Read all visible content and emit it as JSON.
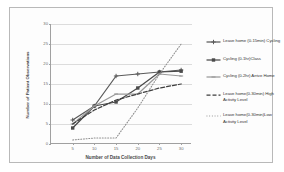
{
  "chart_data": {
    "type": "line",
    "title": "",
    "xlabel": "Number of Data Collection Days",
    "ylabel": "Number of Patient Observations",
    "x": [
      5,
      10,
      15,
      20,
      25,
      30
    ],
    "xlim": [
      0,
      32.5
    ],
    "ylim": [
      0,
      30
    ],
    "xticks": [
      "5",
      "10",
      "15",
      "20",
      "25",
      "30"
    ],
    "yticks": [
      "0",
      "5",
      "10",
      "15",
      "20",
      "25",
      "30"
    ],
    "grid": true,
    "legend_position": "right",
    "series": [
      {
        "name": "Leave home (0-15min) Cycling",
        "values": [
          6,
          9.5,
          17,
          17.5,
          18,
          18.5
        ],
        "color": "#5a5a5a",
        "marker": "plus",
        "dash": "none"
      },
      {
        "name": "Cycling (0-1hr)Class",
        "values": [
          4,
          9.5,
          10.5,
          14,
          18,
          18.2
        ],
        "color": "#4a4a4a",
        "marker": "square",
        "dash": "none"
      },
      {
        "name": "Cycling (0-2hr) Arrive Home",
        "values": [
          5,
          9.5,
          12.5,
          12.5,
          17.5,
          17
        ],
        "color": "#9a9a9a",
        "marker": "line",
        "dash": "none"
      },
      {
        "name": "Leave home(0-30min) High Activity Level",
        "values": [
          5,
          8.5,
          11,
          12.5,
          14,
          15
        ],
        "color": "#3d3d3d",
        "marker": "none",
        "dash": "dashed"
      },
      {
        "name": "Leave home(0-30min)Low Activity Level",
        "values": [
          1,
          1.5,
          1.5,
          9,
          17.5,
          25
        ],
        "color": "#8f8f8f",
        "marker": "none",
        "dash": "dotted"
      }
    ]
  }
}
